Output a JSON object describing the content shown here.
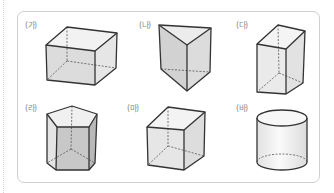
{
  "figures": [
    {
      "id": "ga",
      "label": "(가)",
      "shape": "rectangular-prism"
    },
    {
      "id": "na",
      "label": "(나)",
      "shape": "triangular-prism"
    },
    {
      "id": "da",
      "label": "(다)",
      "shape": "rectangular-prism-tall"
    },
    {
      "id": "ra",
      "label": "(라)",
      "shape": "pentagonal-prism"
    },
    {
      "id": "ma",
      "label": "(마)",
      "shape": "cube"
    },
    {
      "id": "ba",
      "label": "(바)",
      "shape": "cylinder"
    }
  ],
  "colors": {
    "edge": "#333333",
    "hidden_edge": "#555555",
    "face_light": "#eeeeee",
    "face_mid": "#dddddd",
    "face_dark": "#c9c9c9",
    "frame": "#cfcfcf",
    "label": "#8c8c8c"
  }
}
